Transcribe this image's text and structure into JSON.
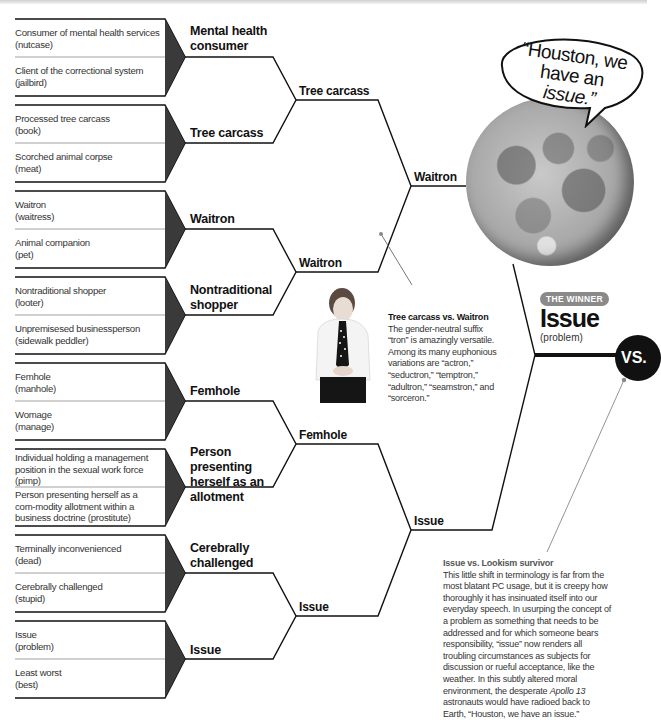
{
  "round1": [
    {
      "matchup": 1,
      "entries": [
        {
          "euphemism": "Consumer of mental health services",
          "plain": "(nutcase)"
        },
        {
          "euphemism": "Client of the correctional system",
          "plain": "(jailbird)"
        }
      ],
      "winner": "Mental health consumer"
    },
    {
      "matchup": 2,
      "entries": [
        {
          "euphemism": "Processed tree carcass",
          "plain": "(book)"
        },
        {
          "euphemism": "Scorched animal corpse",
          "plain": "(meat)"
        }
      ],
      "winner": "Tree carcass"
    },
    {
      "matchup": 3,
      "entries": [
        {
          "euphemism": "Waitron",
          "plain": "(waitress)"
        },
        {
          "euphemism": "Animal companion",
          "plain": "(pet)"
        }
      ],
      "winner": "Waitron"
    },
    {
      "matchup": 4,
      "entries": [
        {
          "euphemism": "Nontraditional shopper",
          "plain": "(looter)"
        },
        {
          "euphemism": "Unpremisesed businessperson",
          "plain": "(sidewalk peddler)"
        }
      ],
      "winner": "Nontraditional shopper"
    },
    {
      "matchup": 5,
      "entries": [
        {
          "euphemism": "Femhole",
          "plain": "(manhole)"
        },
        {
          "euphemism": "Womage",
          "plain": "(manage)"
        }
      ],
      "winner": "Femhole"
    },
    {
      "matchup": 6,
      "entries": [
        {
          "euphemism": "Individual holding a management position in the sexual work force",
          "plain": "(pimp)"
        },
        {
          "euphemism": "Person presenting herself as a commodity allotment within a business doctrine",
          "plain": "(prostitute)"
        }
      ],
      "winner": "Person presenting herself as an allotment"
    },
    {
      "matchup": 7,
      "entries": [
        {
          "euphemism": "Terminally inconvenienced",
          "plain": "(dead)"
        },
        {
          "euphemism": "Cerebrally challenged",
          "plain": "(stupid)"
        }
      ],
      "winner": "Cerebrally challenged"
    },
    {
      "matchup": 8,
      "entries": [
        {
          "euphemism": "Issue",
          "plain": "(problem)"
        },
        {
          "euphemism": "Least worst",
          "plain": "(best)"
        }
      ],
      "winner": "Issue"
    }
  ],
  "round1_labels": {
    "m1": "Mental health consumer",
    "m2": "Tree carcass",
    "m3": "Waitron",
    "m4": "Nontraditional shopper",
    "m5": "Femhole",
    "m6": "Person presenting herself as an allotment",
    "m7": "Cerebrally challenged",
    "m8": "Issue"
  },
  "round2_labels": {
    "a": "Tree carcass",
    "b": "Waitron",
    "c": "Femhole",
    "d": "Issue"
  },
  "round3_labels": {
    "top": "Waitron",
    "bottom": "Issue"
  },
  "entries_text": {
    "e1a": "Consumer of mental health services",
    "e1b": "(nutcase)",
    "e2a": "Client of the correctional system",
    "e2b": "(jailbird)",
    "e3a": "Processed tree carcass",
    "e3b": "(book)",
    "e4a": "Scorched animal corpse",
    "e4b": "(meat)",
    "e5a": "Waitron",
    "e5b": "(waitress)",
    "e6a": "Animal companion",
    "e6b": "(pet)",
    "e7a": "Nontraditional shopper",
    "e7b": "(looter)",
    "e8a": "Unpremisesed businessperson",
    "e8b": "(sidewalk peddler)",
    "e9a": "Femhole",
    "e9b": "(manhole)",
    "e10a": "Womage",
    "e10b": "(manage)",
    "e11a": "Individual holding a management position in the sexual work force",
    "e11b": "(pimp)",
    "e12a": "Person presenting herself as a com-modity allotment within a business doctrine",
    "e12b": "(prostitute)",
    "e13a": "Terminally inconvenienced",
    "e13b": "(dead)",
    "e14a": "Cerebrally challenged",
    "e14b": "(stupid)",
    "e15a": "Issue",
    "e15b": "(problem)",
    "e16a": "Least worst",
    "e16b": "(best)"
  },
  "speech_bubble": {
    "line1": "“Houston, we",
    "line2_prefix": "have an ",
    "line2_italic": "issue.”"
  },
  "winner": {
    "badge": "THE WINNER",
    "name": "Issue",
    "plain": "(problem)",
    "vs_label": "VS."
  },
  "notes": {
    "tree_vs_waitron": {
      "title": "Tree carcass vs. Waitron",
      "body": "The gender-neutral suffix “tron” is amazingly versatile. Among its many euphonious variations are “actron,” “seductron,” “temptron,” “adultron,” “seamstron,” and “sorceron.”"
    },
    "issue_vs_lookism": {
      "title": "Issue vs. Lookism survivor",
      "body_part1": "This little shift in terminology is far from the most blatant PC usage, but it is creepy how thoroughly it has insinuated itself into our everyday speech. In usurping the concept of a problem as something that needs to be addressed and for which someone bears responsibility, “issue” now renders all troubling circumstances as subjects for discussion or rueful acceptance, like the weather. In this subtly altered moral environment, the desperate ",
      "body_italic": "Apollo 13",
      "body_part2": " astronauts would have radioed back to Earth, “Houston, we have an issue.”"
    }
  },
  "colors": {
    "line": "#111111",
    "wedge": "#3a3a3a",
    "badge": "#8a8a8a",
    "vs_circle": "#111111"
  }
}
